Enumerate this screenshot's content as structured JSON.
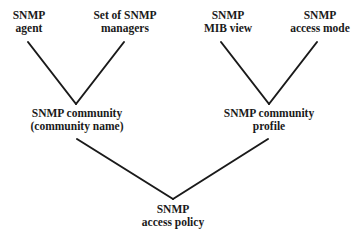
{
  "diagram": {
    "nodes": {
      "agent": {
        "line1": "SNMP",
        "line2": "agent"
      },
      "managers": {
        "line1": "Set of SNMP",
        "line2": "managers"
      },
      "mib_view": {
        "line1": "SNMP",
        "line2": "MIB view"
      },
      "access_mode": {
        "line1": "SNMP",
        "line2": "access mode"
      },
      "community": {
        "line1": "SNMP community",
        "line2": "(community name)"
      },
      "profile": {
        "line1": "SNMP community",
        "line2": "profile"
      },
      "policy": {
        "line1": "SNMP",
        "line2": "access policy"
      }
    },
    "edges": [
      {
        "from": "agent",
        "to": "community"
      },
      {
        "from": "managers",
        "to": "community"
      },
      {
        "from": "mib_view",
        "to": "profile"
      },
      {
        "from": "access_mode",
        "to": "profile"
      },
      {
        "from": "community",
        "to": "policy"
      },
      {
        "from": "profile",
        "to": "policy"
      }
    ],
    "line_color": "#1a1a1a"
  }
}
